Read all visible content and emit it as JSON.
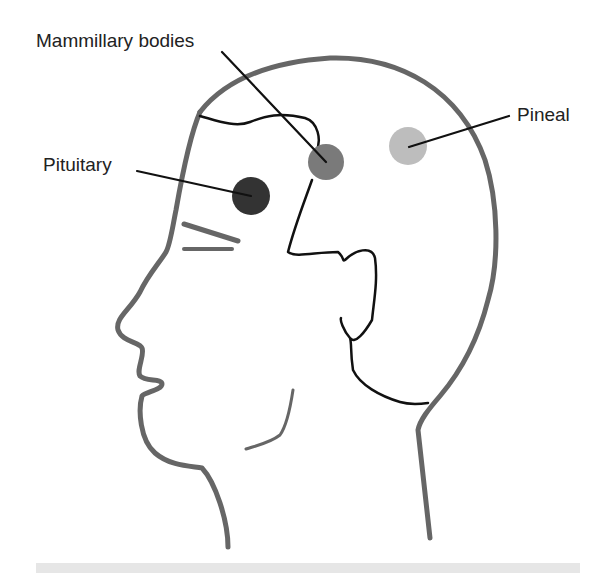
{
  "diagram": {
    "labels": {
      "mammillary": "Mammillary bodies",
      "pituitary": "Pituitary",
      "pineal": "Pineal"
    },
    "colors": {
      "outline": "#666666",
      "inner_lines": "#111111",
      "pituitary_dot": "#333333",
      "mammillary_dot": "#7a7a7a",
      "pineal_dot": "#bdbdbd",
      "bottom_bar": "#e6e6e6"
    }
  }
}
